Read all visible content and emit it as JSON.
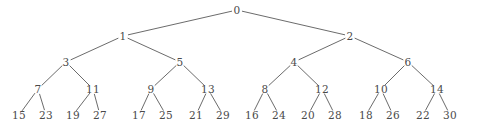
{
  "figure": {
    "width": 477,
    "height": 130,
    "background_color": "#ffffff",
    "edge_color": "#5a5a5a",
    "node_text_color": "#4a4a4a",
    "edge_width": 0.9
  },
  "graph_data": {
    "type": "tree",
    "description": "Complete binary tree of depth 4 with 31 labeled nodes",
    "levels": 5,
    "node_count": 31,
    "edge_count": 30,
    "nodes": [
      {
        "id": "n0",
        "label": "0",
        "x": 237,
        "y": 10,
        "level": 0
      },
      {
        "id": "n1",
        "label": "1",
        "x": 123,
        "y": 36,
        "level": 1
      },
      {
        "id": "n2",
        "label": "2",
        "x": 350,
        "y": 36,
        "level": 1
      },
      {
        "id": "n3",
        "label": "3",
        "x": 66,
        "y": 62,
        "level": 2
      },
      {
        "id": "n5",
        "label": "5",
        "x": 180,
        "y": 62,
        "level": 2
      },
      {
        "id": "n4",
        "label": "4",
        "x": 294,
        "y": 62,
        "level": 2
      },
      {
        "id": "n6",
        "label": "6",
        "x": 408,
        "y": 62,
        "level": 2
      },
      {
        "id": "n7",
        "label": "7",
        "x": 38,
        "y": 89,
        "level": 3
      },
      {
        "id": "n11",
        "label": "11",
        "x": 93,
        "y": 89,
        "level": 3
      },
      {
        "id": "n9",
        "label": "9",
        "x": 151,
        "y": 89,
        "level": 3
      },
      {
        "id": "n13",
        "label": "13",
        "x": 208,
        "y": 89,
        "level": 3
      },
      {
        "id": "n8",
        "label": "8",
        "x": 265,
        "y": 89,
        "level": 3
      },
      {
        "id": "n12",
        "label": "12",
        "x": 322,
        "y": 89,
        "level": 3
      },
      {
        "id": "n10",
        "label": "10",
        "x": 381,
        "y": 89,
        "level": 3
      },
      {
        "id": "n14",
        "label": "14",
        "x": 437,
        "y": 89,
        "level": 3
      },
      {
        "id": "n15",
        "label": "15",
        "x": 19,
        "y": 115,
        "level": 4
      },
      {
        "id": "n23",
        "label": "23",
        "x": 46,
        "y": 115,
        "level": 4
      },
      {
        "id": "n19",
        "label": "19",
        "x": 73,
        "y": 115,
        "level": 4
      },
      {
        "id": "n27",
        "label": "27",
        "x": 100,
        "y": 115,
        "level": 4
      },
      {
        "id": "n17",
        "label": "17",
        "x": 139,
        "y": 115,
        "level": 4
      },
      {
        "id": "n25",
        "label": "25",
        "x": 166,
        "y": 115,
        "level": 4
      },
      {
        "id": "n21",
        "label": "21",
        "x": 196,
        "y": 115,
        "level": 4
      },
      {
        "id": "n29",
        "label": "29",
        "x": 223,
        "y": 115,
        "level": 4
      },
      {
        "id": "n16",
        "label": "16",
        "x": 252,
        "y": 115,
        "level": 4
      },
      {
        "id": "n24",
        "label": "24",
        "x": 279,
        "y": 115,
        "level": 4
      },
      {
        "id": "n20",
        "label": "20",
        "x": 308,
        "y": 115,
        "level": 4
      },
      {
        "id": "n28",
        "label": "28",
        "x": 335,
        "y": 115,
        "level": 4
      },
      {
        "id": "n18",
        "label": "18",
        "x": 366,
        "y": 115,
        "level": 4
      },
      {
        "id": "n26",
        "label": "26",
        "x": 393,
        "y": 115,
        "level": 4
      },
      {
        "id": "n22",
        "label": "22",
        "x": 423,
        "y": 115,
        "level": 4
      },
      {
        "id": "n30",
        "label": "30",
        "x": 450,
        "y": 115,
        "level": 4
      }
    ],
    "edges": [
      {
        "from": "n0",
        "to": "n1"
      },
      {
        "from": "n0",
        "to": "n2"
      },
      {
        "from": "n1",
        "to": "n3"
      },
      {
        "from": "n1",
        "to": "n5"
      },
      {
        "from": "n2",
        "to": "n4"
      },
      {
        "from": "n2",
        "to": "n6"
      },
      {
        "from": "n3",
        "to": "n7"
      },
      {
        "from": "n3",
        "to": "n11"
      },
      {
        "from": "n5",
        "to": "n9"
      },
      {
        "from": "n5",
        "to": "n13"
      },
      {
        "from": "n4",
        "to": "n8"
      },
      {
        "from": "n4",
        "to": "n12"
      },
      {
        "from": "n6",
        "to": "n10"
      },
      {
        "from": "n6",
        "to": "n14"
      },
      {
        "from": "n7",
        "to": "n15"
      },
      {
        "from": "n7",
        "to": "n23"
      },
      {
        "from": "n11",
        "to": "n19"
      },
      {
        "from": "n11",
        "to": "n27"
      },
      {
        "from": "n9",
        "to": "n17"
      },
      {
        "from": "n9",
        "to": "n25"
      },
      {
        "from": "n13",
        "to": "n21"
      },
      {
        "from": "n13",
        "to": "n29"
      },
      {
        "from": "n8",
        "to": "n16"
      },
      {
        "from": "n8",
        "to": "n24"
      },
      {
        "from": "n12",
        "to": "n20"
      },
      {
        "from": "n12",
        "to": "n28"
      },
      {
        "from": "n10",
        "to": "n18"
      },
      {
        "from": "n10",
        "to": "n26"
      },
      {
        "from": "n14",
        "to": "n22"
      },
      {
        "from": "n14",
        "to": "n30"
      }
    ]
  }
}
